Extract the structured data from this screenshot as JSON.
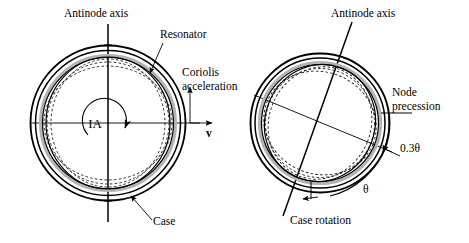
{
  "figure": {
    "domain": "diagram",
    "background_color": "#ffffff",
    "ink_color": "#000000",
    "gray_band_color": "#b4b4b4",
    "width": 469,
    "height": 243
  },
  "left_panel": {
    "name": "resonator-at-rest",
    "labels": {
      "antinode_axis": "Antinode axis",
      "resonator": "Resonator",
      "coriolis_line1": "Coriolis",
      "coriolis_line2": "acceleration",
      "input_axis": "IA",
      "velocity": "v",
      "case": "Case"
    },
    "geometry": {
      "center_x": 108,
      "center_y": 123,
      "outer_radius": 78,
      "antinode_axis_angle_deg": 0
    }
  },
  "right_panel": {
    "name": "resonator-after-case-rotation",
    "labels": {
      "antinode_axis": "Antinode axis",
      "node_precession_line1": "Node",
      "node_precession_line2": "precession",
      "precession_angle": "0.3θ",
      "case_angle": "θ",
      "case_rotation": "Case rotation"
    },
    "geometry": {
      "center_x": 320,
      "center_y": 123,
      "outer_radius": 70,
      "antinode_axis_angle_deg": 20,
      "node_axis_angle_deg": 20
    }
  }
}
